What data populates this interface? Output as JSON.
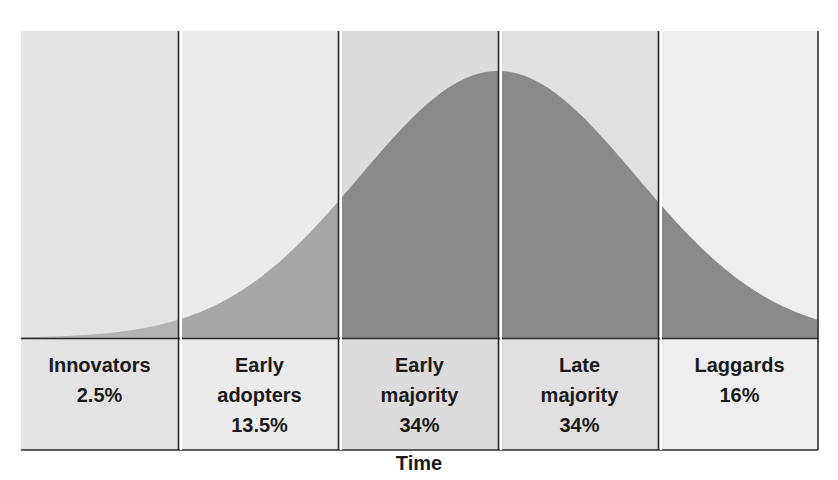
{
  "chart_data": {
    "type": "area",
    "title": "",
    "xlabel": "Time",
    "ylabel": "",
    "distribution": "normal (bell curve)",
    "categories": [
      "Innovators",
      "Early adopters",
      "Early majority",
      "Late majority",
      "Laggards"
    ],
    "values": [
      2.5,
      13.5,
      34,
      34,
      16
    ],
    "unit": "%",
    "segments": [
      {
        "name": "Innovators",
        "label_lines": [
          "Innovators",
          "2.5%"
        ],
        "percent": 2.5,
        "shade": "#b3b3b3",
        "bg": "#e4e4e4"
      },
      {
        "name": "Early adopters",
        "label_lines": [
          "Early",
          "adopters",
          "13.5%"
        ],
        "percent": 13.5,
        "shade": "#a6a6a6",
        "bg": "#ececec"
      },
      {
        "name": "Early majority",
        "label_lines": [
          "Early",
          "majority",
          "34%"
        ],
        "percent": 34,
        "shade": "#8a8a8a",
        "bg": "#dedede"
      },
      {
        "name": "Late majority",
        "label_lines": [
          "Late",
          "majority",
          "34%"
        ],
        "percent": 34,
        "shade": "#8a8a8a",
        "bg": "#e2e2e2"
      },
      {
        "name": "Laggards",
        "label_lines": [
          "Laggards",
          "16%"
        ],
        "percent": 16,
        "shade": "#8a8a8a",
        "bg": "#eeeeee"
      }
    ],
    "grid": false,
    "legend": "none"
  },
  "labels": {
    "innovators": {
      "name": "Innovators",
      "pct": "2.5%"
    },
    "early_adopters": {
      "name1": "Early",
      "name2": "adopters",
      "pct": "13.5%"
    },
    "early_majority": {
      "name1": "Early",
      "name2": "majority",
      "pct": "34%"
    },
    "late_majority": {
      "name1": "Late",
      "name2": "majority",
      "pct": "34%"
    },
    "laggards": {
      "name": "Laggards",
      "pct": "16%"
    }
  },
  "axis": {
    "x_label": "Time"
  },
  "colors": {
    "line": "#2a2a2a",
    "curve_dark": "#8a8a8a",
    "curve_light": "#b0b0b0"
  }
}
